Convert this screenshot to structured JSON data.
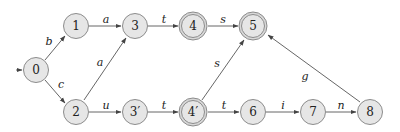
{
  "diagram": {
    "type": "finite-state-automaton",
    "start_state": "0",
    "states": [
      {
        "id": "s0",
        "label": "0",
        "x": 36,
        "y": 70,
        "accepting": false
      },
      {
        "id": "s1",
        "label": "1",
        "x": 76,
        "y": 26,
        "accepting": false
      },
      {
        "id": "s3",
        "label": "3",
        "x": 135,
        "y": 26,
        "accepting": false
      },
      {
        "id": "s4",
        "label": "4",
        "x": 193,
        "y": 26,
        "accepting": true
      },
      {
        "id": "s5",
        "label": "5",
        "x": 253,
        "y": 26,
        "accepting": true
      },
      {
        "id": "s2",
        "label": "2",
        "x": 76,
        "y": 112,
        "accepting": false
      },
      {
        "id": "s3p",
        "label": "3′",
        "x": 135,
        "y": 112,
        "accepting": false
      },
      {
        "id": "s4p",
        "label": "4′",
        "x": 193,
        "y": 112,
        "accepting": true
      },
      {
        "id": "s6",
        "label": "6",
        "x": 253,
        "y": 112,
        "accepting": false
      },
      {
        "id": "s7",
        "label": "7",
        "x": 313,
        "y": 112,
        "accepting": false
      },
      {
        "id": "s8",
        "label": "8",
        "x": 370,
        "y": 112,
        "accepting": false
      }
    ],
    "transitions": [
      {
        "from": "0",
        "to": "1",
        "label": "b"
      },
      {
        "from": "0",
        "to": "2",
        "label": "c"
      },
      {
        "from": "1",
        "to": "3",
        "label": "a"
      },
      {
        "from": "2",
        "to": "3",
        "label": "a"
      },
      {
        "from": "3",
        "to": "4",
        "label": "t"
      },
      {
        "from": "4",
        "to": "5",
        "label": "s"
      },
      {
        "from": "2",
        "to": "3′",
        "label": "u"
      },
      {
        "from": "3′",
        "to": "4′",
        "label": "t"
      },
      {
        "from": "4′",
        "to": "5",
        "label": "s"
      },
      {
        "from": "4′",
        "to": "6",
        "label": "t"
      },
      {
        "from": "6",
        "to": "7",
        "label": "i"
      },
      {
        "from": "7",
        "to": "8",
        "label": "n"
      },
      {
        "from": "8",
        "to": "5",
        "label": "g"
      }
    ]
  }
}
